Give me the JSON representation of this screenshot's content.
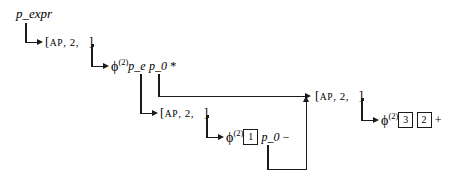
{
  "figure": {
    "title": "p_expr",
    "root_label": "p_expr",
    "cell_bracket_open": "[",
    "cell_bracket_close": "]",
    "cell_tag": "AP",
    "cell_arity": "2",
    "cell_comma": ",",
    "phi_symbol": "ϕ",
    "phi_superscript": "(2)"
  },
  "nodes": {
    "root": {
      "name": "p_expr",
      "label": "p_expr"
    },
    "ap1": {
      "name": "ap-cell-1",
      "tag": "AP",
      "arity": "2",
      "open": "[",
      "close": "]",
      "comma1": ",",
      "comma2": ","
    },
    "closure1": {
      "name": "closure-mul",
      "phi": "ϕ",
      "sup": "(2)",
      "args": [
        "p_e",
        "p_0"
      ],
      "op": "*"
    },
    "ap2": {
      "name": "ap-cell-2",
      "tag": "AP",
      "arity": "2",
      "open": "[",
      "close": "]",
      "comma1": ",",
      "comma2": ","
    },
    "closure2": {
      "name": "closure-sub",
      "phi": "ϕ",
      "sup": "(2)",
      "boxed": [
        "1"
      ],
      "args": [
        "p_0"
      ],
      "op": "−"
    },
    "ap3": {
      "name": "ap-cell-3",
      "tag": "AP",
      "arity": "2",
      "open": "[",
      "close": "]",
      "comma1": ",",
      "comma2": ","
    },
    "closure3": {
      "name": "closure-add",
      "phi": "ϕ",
      "sup": "(2)",
      "boxed": [
        "3",
        "2"
      ],
      "op": "+"
    }
  },
  "colors": {
    "ink": "#1a1a1a",
    "background": "#ffffff"
  }
}
